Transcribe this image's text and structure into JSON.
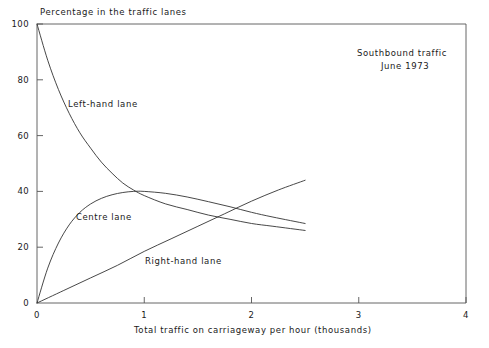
{
  "chart_data": {
    "type": "line",
    "title": "",
    "xlabel": "Total traffic on carriageway per hour (thousands)",
    "ylabel": "Percentage in the traffic lanes",
    "xlim": [
      0,
      4
    ],
    "ylim": [
      0,
      100
    ],
    "xticks": [
      "0",
      "1",
      "2",
      "3",
      "4"
    ],
    "xtick_values": [
      0,
      1,
      2,
      3,
      4
    ],
    "yticks": [
      "0",
      "20",
      "40",
      "60",
      "80",
      "100"
    ],
    "ytick_values": [
      0,
      20,
      40,
      60,
      80,
      100
    ],
    "grid": false,
    "legend": "inline-labels",
    "annotations": [
      {
        "name": "direction",
        "text": "Southbound traffic"
      },
      {
        "name": "period",
        "text": "June 1973"
      }
    ],
    "series": [
      {
        "name": "Left-hand lane",
        "label": "Left-hand lane",
        "color": "#333333",
        "x": [
          0.0,
          0.1,
          0.2,
          0.3,
          0.4,
          0.5,
          0.6,
          0.7,
          0.8,
          0.9,
          1.0,
          1.2,
          1.4,
          1.6,
          1.8,
          2.0,
          2.2,
          2.5
        ],
        "y": [
          100.0,
          87.0,
          76.5,
          68.0,
          61.0,
          55.5,
          50.5,
          46.5,
          43.0,
          40.5,
          38.5,
          35.5,
          33.5,
          31.5,
          30.0,
          28.5,
          27.5,
          26.0
        ]
      },
      {
        "name": "Centre lane",
        "label": "Centre lane",
        "color": "#333333",
        "x": [
          0.0,
          0.1,
          0.2,
          0.3,
          0.4,
          0.5,
          0.6,
          0.7,
          0.8,
          0.9,
          1.0,
          1.2,
          1.4,
          1.6,
          1.8,
          2.0,
          2.2,
          2.5
        ],
        "y": [
          0.0,
          12.5,
          21.5,
          28.0,
          32.5,
          35.5,
          37.5,
          38.8,
          39.6,
          40.0,
          40.0,
          39.3,
          38.0,
          36.3,
          34.5,
          32.5,
          30.8,
          28.5
        ]
      },
      {
        "name": "Right-hand lane",
        "label": "Right-hand lane",
        "color": "#333333",
        "x": [
          0.0,
          0.25,
          0.5,
          0.75,
          1.0,
          1.25,
          1.5,
          1.75,
          2.0,
          2.25,
          2.5
        ],
        "y": [
          0.0,
          4.5,
          9.0,
          13.5,
          18.5,
          23.0,
          27.5,
          32.0,
          36.5,
          40.5,
          44.0
        ]
      }
    ]
  },
  "axes": {
    "y_title": "Percentage in the traffic lanes",
    "x_title": "Total traffic on carriageway per hour (thousands)"
  },
  "annotation": {
    "line1": "Southbound traffic",
    "line2": "June 1973"
  },
  "series_labels": {
    "left": "Left-hand lane",
    "centre": "Centre lane",
    "right": "Right-hand lane"
  },
  "ytick_labels": [
    "100",
    "80",
    "60",
    "40",
    "20",
    "0"
  ],
  "xtick_labels": [
    "0",
    "1",
    "2",
    "3",
    "4"
  ],
  "style": {
    "line_color": "#333333",
    "axis_color": "#555555",
    "background": "#ffffff"
  }
}
